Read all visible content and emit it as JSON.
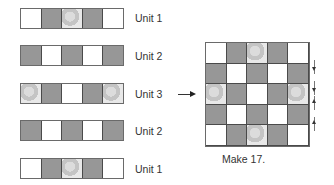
{
  "units": [
    {
      "label": "Unit 1",
      "cells": [
        "w",
        "g",
        "p",
        "g",
        "w"
      ]
    },
    {
      "label": "Unit 2",
      "cells": [
        "g",
        "w",
        "g",
        "w",
        "g"
      ]
    },
    {
      "label": "Unit 3",
      "cells": [
        "p",
        "g",
        "w",
        "g",
        "p"
      ]
    },
    {
      "label": "Unit 2",
      "cells": [
        "g",
        "w",
        "g",
        "w",
        "g"
      ]
    },
    {
      "label": "Unit 1",
      "cells": [
        "w",
        "g",
        "p",
        "g",
        "w"
      ]
    }
  ],
  "caption": "Make 17.",
  "pressing_arrows": [
    "down",
    "down",
    "up",
    "up"
  ],
  "colors": {
    "white": "#ffffff",
    "gray": "#979797",
    "print": "#d0d0d0",
    "outline": "#4a4a4a"
  }
}
